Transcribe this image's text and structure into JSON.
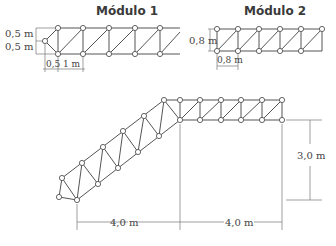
{
  "module1": {
    "title": "Módulo 1",
    "dims": {
      "h_top": "0,5 m",
      "h_bottom": "0,5 m",
      "w_first": "0,5",
      "w_panel": "1 m"
    }
  },
  "module2": {
    "title": "Módulo 2",
    "dims": {
      "height": "0,8 m",
      "width": "0,8 m"
    }
  },
  "structure": {
    "dims": {
      "horizontal_left": "4,0 m",
      "horizontal_right": "4,0 m",
      "vertical": "3,0 m"
    }
  },
  "colors": {
    "line": "#555555",
    "background": "#ffffff"
  }
}
